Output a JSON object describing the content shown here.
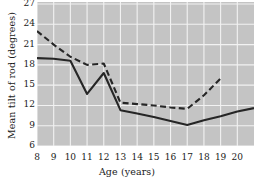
{
  "chart_data": {
    "type": "line",
    "title": "",
    "xlabel": "Age  (years)",
    "ylabel": "Mean tilt of rod  (degrees)",
    "xlim": [
      8,
      21
    ],
    "ylim": [
      6,
      27.3
    ],
    "grid": true,
    "legend": "none",
    "xticks": [
      8,
      9,
      10,
      11,
      12,
      13,
      14,
      15,
      16,
      17,
      18,
      19,
      20
    ],
    "yticks": [
      6,
      9,
      12,
      15,
      18,
      21,
      24,
      27
    ],
    "xtick_labels": [
      "8",
      "9",
      "10",
      "11",
      "12",
      "13",
      "14",
      "15",
      "16",
      "17",
      "18",
      "19",
      "20"
    ],
    "ytick_labels": [
      "6",
      "9",
      "12",
      "15",
      "18",
      "21",
      "24",
      "27"
    ],
    "x": [
      8,
      9,
      10,
      11,
      12,
      13,
      14,
      15,
      16,
      17,
      18,
      19,
      20,
      21
    ],
    "series": [
      {
        "name": "solid",
        "style": "solid",
        "color": "#262626",
        "x": [
          8,
          9,
          10,
          11,
          12,
          13,
          14,
          15,
          16,
          17,
          18,
          19,
          20,
          21
        ],
        "values": [
          19.0,
          18.9,
          18.6,
          13.7,
          16.8,
          11.3,
          10.8,
          10.3,
          9.7,
          9.1,
          9.8,
          10.4,
          11.1,
          11.6
        ]
      },
      {
        "name": "dashed",
        "style": "dashed",
        "color": "#262626",
        "x": [
          8,
          9,
          10,
          11,
          12,
          13,
          14,
          15,
          16,
          17,
          18,
          19
        ],
        "values": [
          23.0,
          21.0,
          19.2,
          18.0,
          18.2,
          12.4,
          12.2,
          12.0,
          11.7,
          11.5,
          13.5,
          16.0
        ]
      }
    ],
    "colors": {
      "plot_background": "#c4c4c4",
      "gridline": "#f2f2f2",
      "line": "#262626",
      "text": "#1a1a1a",
      "page_background": "#ffffff"
    }
  }
}
